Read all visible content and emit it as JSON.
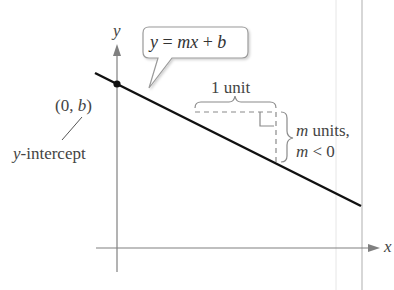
{
  "diagram": {
    "axes": {
      "x_label": "x",
      "y_label": "y"
    },
    "equation_callout": {
      "var_y": "y",
      "eq": " = ",
      "mx": "mx",
      "plus": " + ",
      "b": "b"
    },
    "intercept": {
      "point_open": "(0, ",
      "point_b": "b",
      "point_close": ")",
      "label_var": "y",
      "label_rest": "-intercept"
    },
    "run_label": "1 unit",
    "rise": {
      "line1_var": "m",
      "line1_rest": " units,",
      "line2_var": "m",
      "line2_rest": " < 0"
    },
    "colors": {
      "line": "#111111",
      "axis": "#777777",
      "text": "#444444",
      "dashed": "#888888",
      "callout_border": "#999999"
    }
  }
}
